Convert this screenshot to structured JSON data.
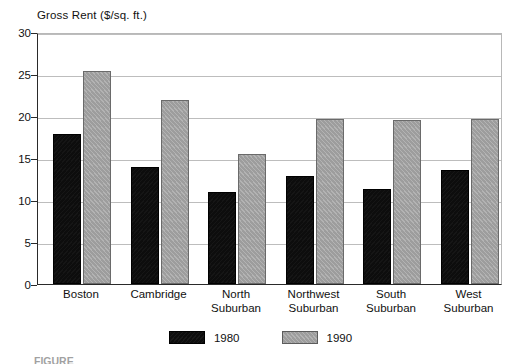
{
  "chart_data": {
    "type": "bar",
    "title": "Gross Rent ($/sq. ft.)",
    "xlabel": "",
    "ylabel": "Gross Rent ($/sq. ft.)",
    "ylim": [
      0,
      30
    ],
    "yticks": [
      0,
      5,
      10,
      15,
      20,
      25,
      30
    ],
    "ytick_labels": [
      "0",
      "5",
      "10",
      "15",
      "20",
      "25",
      "30"
    ],
    "grid": true,
    "legend_position": "bottom-center",
    "categories": [
      "Boston",
      "Cambridge",
      "North Suburban",
      "Northwest Suburban",
      "South Suburban",
      "West Suburban"
    ],
    "category_lines": [
      [
        "Boston",
        ""
      ],
      [
        "Cambridge",
        ""
      ],
      [
        "North",
        "Suburban"
      ],
      [
        "Northwest",
        "Suburban"
      ],
      [
        "South",
        "Suburban"
      ],
      [
        "West",
        "Suburban"
      ]
    ],
    "series": [
      {
        "name": "1980",
        "color": "#0d0d0d",
        "values": [
          17.8,
          13.9,
          10.9,
          12.8,
          11.3,
          13.6
        ]
      },
      {
        "name": "1990",
        "color": "#a5a5a5",
        "values": [
          25.4,
          21.9,
          15.5,
          19.6,
          19.5,
          19.6
        ]
      }
    ]
  },
  "legend": {
    "items": [
      {
        "label": "1980",
        "swatch": "black-swatch"
      },
      {
        "label": "1990",
        "swatch": "gray-swatch"
      }
    ]
  },
  "caption": {
    "text": "FIGURE"
  }
}
